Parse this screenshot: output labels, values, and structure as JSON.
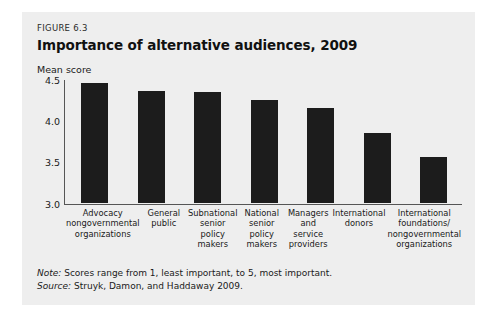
{
  "figure": {
    "number": "FIGURE 6.3",
    "title": "Importance of alternative audiences, 2009",
    "note_label": "Note:",
    "note_text": " Scores range from 1, least important, to 5, most important.",
    "source_label": "Source:",
    "source_text": " Struyk, Damon, and Haddaway 2009.",
    "panel_bg": "#eeeeee",
    "bar_color": "#1c1c1c",
    "axis_color": "#555555"
  },
  "chart_data": {
    "type": "bar",
    "title": "Importance of alternative audiences, 2009",
    "xlabel": "",
    "ylabel": "Mean score",
    "ylim": [
      3.0,
      4.5
    ],
    "yticks": [
      "3.0",
      "3.5",
      "4.0",
      "4.5"
    ],
    "ytick_values": [
      3.0,
      3.5,
      4.0,
      4.5
    ],
    "grid": false,
    "legend": "none",
    "categories": [
      "Advocacy nongovernmental organizations",
      "General public",
      "Subnational senior policy makers",
      "National senior policy makers",
      "Managers and service providers",
      "International donors",
      "International foundations/ nongovernmental organizations"
    ],
    "category_lines": [
      [
        "Advocacy",
        "nongovernmental",
        "organizations"
      ],
      [
        "General",
        "public"
      ],
      [
        "Subnational",
        "senior",
        "policy makers"
      ],
      [
        "National",
        "senior",
        "policy makers"
      ],
      [
        "Managers",
        "and service",
        "providers"
      ],
      [
        "International",
        "donors"
      ],
      [
        "International",
        "foundations/",
        "nongovernmental",
        "organizations"
      ]
    ],
    "values": [
      4.45,
      4.35,
      4.34,
      4.25,
      4.15,
      3.84,
      3.55
    ]
  }
}
